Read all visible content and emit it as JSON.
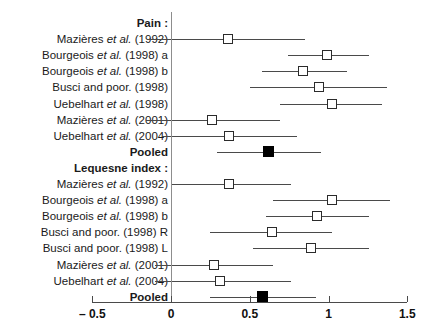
{
  "chart_data": {
    "type": "scatter",
    "title": "",
    "xlabel": "",
    "ylabel": "",
    "xlim": [
      -0.5,
      1.5
    ],
    "grid": false,
    "legend": null,
    "reference_line": 0,
    "axis_ticks": [
      {
        "value": -0.5,
        "label": "– 0.5"
      },
      {
        "value": 0,
        "label": "0"
      },
      {
        "value": 0.5,
        "label": "0.5"
      },
      {
        "value": 1,
        "label": "1"
      },
      {
        "value": 1.5,
        "label": "1.5"
      }
    ],
    "groups": [
      {
        "heading": "Pain :",
        "rows": [
          {
            "label_pre": "Mazières ",
            "label_it": "et al.",
            "label_post": " (1992)",
            "estimate": 0.36,
            "ci_low": -0.15,
            "ci_high": 0.85,
            "marker": "open"
          },
          {
            "label_pre": "Bourgeois ",
            "label_it": "et al.",
            "label_post": " (1998) a",
            "estimate": 0.99,
            "ci_low": 0.74,
            "ci_high": 1.26,
            "marker": "open"
          },
          {
            "label_pre": "Bourgeois ",
            "label_it": "et al.",
            "label_post": " (1998) b",
            "estimate": 0.84,
            "ci_low": 0.58,
            "ci_high": 1.12,
            "marker": "open"
          },
          {
            "label_pre": "Busci and poor. (1998)",
            "label_it": "",
            "label_post": "",
            "estimate": 0.94,
            "ci_low": 0.5,
            "ci_high": 1.37,
            "marker": "open"
          },
          {
            "label_pre": "Uebelhart ",
            "label_it": "et al.",
            "label_post": " (1998)",
            "estimate": 1.02,
            "ci_low": 0.69,
            "ci_high": 1.34,
            "marker": "open"
          },
          {
            "label_pre": "Mazières ",
            "label_it": "et al.",
            "label_post": " (2001)",
            "estimate": 0.26,
            "ci_low": -0.16,
            "ci_high": 0.69,
            "marker": "open"
          },
          {
            "label_pre": "Uebelhart ",
            "label_it": "et al.",
            "label_post": " (2004)",
            "estimate": 0.37,
            "ci_low": -0.06,
            "ci_high": 0.8,
            "marker": "open"
          },
          {
            "label_pre": "Pooled",
            "label_it": "",
            "label_post": "",
            "estimate": 0.62,
            "ci_low": 0.29,
            "ci_high": 0.95,
            "marker": "filled",
            "bold": true
          }
        ]
      },
      {
        "heading": "Lequesne index :",
        "rows": [
          {
            "label_pre": "Mazières ",
            "label_it": "et al.",
            "label_post": " (1992)",
            "estimate": 0.37,
            "ci_low": 0.0,
            "ci_high": 0.76,
            "marker": "open"
          },
          {
            "label_pre": "Bourgeois ",
            "label_it": "et al.",
            "label_post": " (1998) a",
            "estimate": 1.02,
            "ci_low": 0.65,
            "ci_high": 1.39,
            "marker": "open"
          },
          {
            "label_pre": "Bourgeois ",
            "label_it": "et al.",
            "label_post": " (1998) b",
            "estimate": 0.93,
            "ci_low": 0.6,
            "ci_high": 1.26,
            "marker": "open"
          },
          {
            "label_pre": "Busci and poor. (1998) R",
            "label_it": "",
            "label_post": "",
            "estimate": 0.64,
            "ci_low": 0.25,
            "ci_high": 1.02,
            "marker": "open"
          },
          {
            "label_pre": "Busci and poor. (1998) L",
            "label_it": "",
            "label_post": "",
            "estimate": 0.89,
            "ci_low": 0.52,
            "ci_high": 1.26,
            "marker": "open"
          },
          {
            "label_pre": "Mazières ",
            "label_it": "et al.",
            "label_post": " (2001)",
            "estimate": 0.27,
            "ci_low": -0.1,
            "ci_high": 0.65,
            "marker": "open"
          },
          {
            "label_pre": "Uebelhart ",
            "label_it": "et al.",
            "label_post": " (2004)",
            "estimate": 0.31,
            "ci_low": -0.1,
            "ci_high": 0.76,
            "marker": "open"
          },
          {
            "label_pre": "Pooled",
            "label_it": "",
            "label_post": "",
            "estimate": 0.58,
            "ci_low": 0.25,
            "ci_high": 0.92,
            "marker": "filled",
            "bold": true
          }
        ]
      }
    ],
    "colors": {
      "line": "#4a4a4a",
      "marker_open_fill": "#ffffff",
      "marker_edge": "#2b2b2b",
      "marker_filled": "#000000",
      "reference_line": "#8d8d8d",
      "text": "#111111"
    }
  }
}
